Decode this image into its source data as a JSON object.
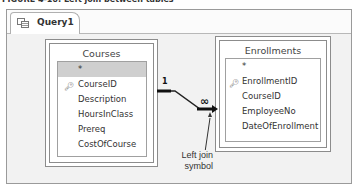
{
  "caption": "FIGURE 4-16: Left join between tables",
  "tab": {
    "label": "Query1",
    "icon": "query-icon"
  },
  "tables": [
    {
      "name": "Courses",
      "fields": [
        {
          "label": "*",
          "selected": true,
          "key": false
        },
        {
          "label": "CourseID",
          "selected": false,
          "key": true
        },
        {
          "label": "Description",
          "selected": false,
          "key": false
        },
        {
          "label": "HoursInClass",
          "selected": false,
          "key": false
        },
        {
          "label": "Prereq",
          "selected": false,
          "key": false
        },
        {
          "label": "CostOfCourse",
          "selected": false,
          "key": false
        }
      ]
    },
    {
      "name": "Enrollments",
      "fields": [
        {
          "label": "*",
          "selected": false,
          "key": false
        },
        {
          "label": "EnrollmentID",
          "selected": false,
          "key": true
        },
        {
          "label": "CourseID",
          "selected": false,
          "key": false
        },
        {
          "label": "EmployeeNo",
          "selected": false,
          "key": false
        },
        {
          "label": "DateOfEnrollment",
          "selected": false,
          "key": false
        }
      ]
    }
  ],
  "join": {
    "one_side": "1",
    "many_side": "∞"
  },
  "annotation": {
    "line1": "Left join",
    "line2": "symbol"
  },
  "colors": {
    "canvas": "#f2f2f2",
    "selected_row": "#cfcfcf",
    "border": "#8c8c8c"
  }
}
